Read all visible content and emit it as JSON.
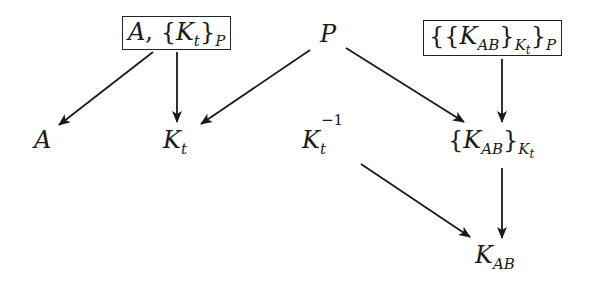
{
  "diagram": {
    "type": "derivation-tree",
    "nodes": [
      {
        "id": "box1",
        "parts": {
          "a": "A",
          "comma": ",",
          "lb": "{",
          "k": "K",
          "t": "t",
          "rb": "}",
          "p": "P"
        },
        "boxed": true,
        "text": "A, {K_t}_P"
      },
      {
        "id": "P",
        "label": "P",
        "text": "P"
      },
      {
        "id": "box2",
        "parts": {
          "lb1": "{",
          "lb2": "{",
          "k": "K",
          "ab": "AB",
          "rb2": "}",
          "kk": "K",
          "t": "t",
          "rb1": "}",
          "p": "P"
        },
        "boxed": true,
        "text": "{{K_AB}_K_t}_P"
      },
      {
        "id": "A",
        "label": "A",
        "text": "A"
      },
      {
        "id": "Kt",
        "parts": {
          "k": "K",
          "t": "t"
        },
        "text": "K_t"
      },
      {
        "id": "KtInv",
        "parts": {
          "k": "K",
          "t": "t",
          "exp": "−1"
        },
        "text": "K_t^{-1}"
      },
      {
        "id": "KABenc",
        "parts": {
          "lb": "{",
          "k": "K",
          "ab": "AB",
          "rb": "}",
          "kk": "K",
          "t": "t"
        },
        "text": "{K_AB}_K_t"
      },
      {
        "id": "KAB",
        "parts": {
          "k": "K",
          "ab": "AB"
        },
        "text": "K_AB"
      }
    ],
    "edges": [
      {
        "from": "box1",
        "to": "A"
      },
      {
        "from": "box1",
        "to": "Kt"
      },
      {
        "from": "P",
        "to": "Kt"
      },
      {
        "from": "P",
        "to": "KABenc"
      },
      {
        "from": "box2",
        "to": "KABenc"
      },
      {
        "from": "KtInv",
        "to": "KAB"
      },
      {
        "from": "KABenc",
        "to": "KAB"
      }
    ],
    "colors": {
      "ink": "#1a1a1a",
      "background": "#ffffff"
    }
  }
}
